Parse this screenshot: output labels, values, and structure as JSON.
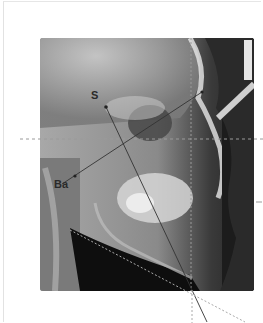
{
  "figure": {
    "type": "lateral cephalometric radiograph",
    "landmarks": [
      {
        "label": "S",
        "x": 106,
        "y": 107
      },
      {
        "label": "Ba",
        "x": 62,
        "y": 184
      }
    ],
    "colors": {
      "background": "#ffffff",
      "line": "#333333",
      "dashed_line": "#9a9a9a",
      "soft_tissue_dark": "#1a1a1a",
      "bone_light": "#d8d8d8"
    }
  }
}
